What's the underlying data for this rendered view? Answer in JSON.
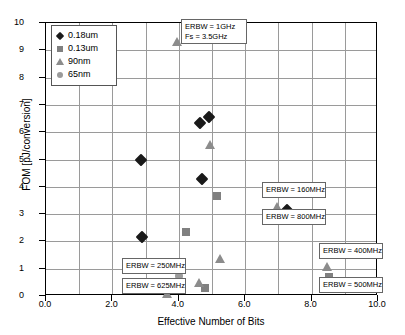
{
  "chart_data": {
    "type": "scatter",
    "title": "",
    "xlabel": "Effective Number of Bits",
    "ylabel": "FOM [pJ/conversion]",
    "xlim": [
      0.0,
      10.0
    ],
    "ylim": [
      0,
      10
    ],
    "xticks": [
      "0.0",
      "2.0",
      "4.0",
      "6.0",
      "8.0",
      "10.0"
    ],
    "xtick_values": [
      0,
      2,
      4,
      6,
      8,
      10
    ],
    "yticks": [
      "0",
      "1",
      "2",
      "3",
      "4",
      "5",
      "6",
      "7",
      "8",
      "9",
      "10"
    ],
    "ytick_values": [
      0,
      1,
      2,
      3,
      4,
      5,
      6,
      7,
      8,
      9,
      10
    ],
    "grid": "both",
    "grid_x_step": 1.0,
    "grid_y_step": 1.0,
    "legend_position": "top-left",
    "series": [
      {
        "name": "0.18um",
        "marker": "diamond",
        "color": "#1a1a1a",
        "points": [
          {
            "x": 2.85,
            "y": 5.0
          },
          {
            "x": 4.63,
            "y": 6.35
          },
          {
            "x": 4.92,
            "y": 6.57
          },
          {
            "x": 4.7,
            "y": 4.28
          },
          {
            "x": 2.88,
            "y": 2.15
          },
          {
            "x": 7.25,
            "y": 3.15
          }
        ]
      },
      {
        "name": "0.13um",
        "marker": "square",
        "color": "#808080",
        "points": [
          {
            "x": 5.15,
            "y": 3.68
          },
          {
            "x": 4.23,
            "y": 2.35
          },
          {
            "x": 4.8,
            "y": 0.28
          },
          {
            "x": 8.52,
            "y": 0.7
          }
        ]
      },
      {
        "name": "90nm",
        "marker": "triangle",
        "color": "#8c8c8c",
        "points": [
          {
            "x": 3.95,
            "y": 9.3
          },
          {
            "x": 4.95,
            "y": 5.53
          },
          {
            "x": 5.25,
            "y": 1.35
          },
          {
            "x": 6.95,
            "y": 3.28
          },
          {
            "x": 4.62,
            "y": 0.47
          },
          {
            "x": 3.63,
            "y": 0.08
          },
          {
            "x": 8.47,
            "y": 1.05
          }
        ]
      },
      {
        "name": "65nm",
        "marker": "circle",
        "color": "#9b9b9b",
        "points": [
          {
            "x": 4.0,
            "y": 0.75
          }
        ]
      }
    ],
    "annotations": [
      {
        "id": "anno-erbw-1ghz",
        "lines": [
          "ERBW = 1GHz",
          "Fs = 3.5GHz"
        ],
        "left": 181,
        "top": 19,
        "width": 66
      },
      {
        "id": "anno-erbw-160mhz",
        "lines": [
          "ERBW = 160MHz"
        ],
        "left": 262,
        "top": 182,
        "width": 64
      },
      {
        "id": "anno-erbw-800mhz",
        "lines": [
          "ERBW = 800MHz"
        ],
        "left": 262,
        "top": 209,
        "width": 64
      },
      {
        "id": "anno-erbw-250mhz",
        "lines": [
          "ERBW = 250MHz"
        ],
        "left": 122,
        "top": 258,
        "width": 64
      },
      {
        "id": "anno-erbw-625mhz",
        "lines": [
          "ERBW = 625MHz"
        ],
        "left": 122,
        "top": 278,
        "width": 64
      },
      {
        "id": "anno-erbw-400mhz",
        "lines": [
          "ERBW = 400MHz"
        ],
        "left": 319,
        "top": 243,
        "width": 64
      },
      {
        "id": "anno-erbw-500mhz",
        "lines": [
          "ERBW = 500MHz"
        ],
        "left": 319,
        "top": 277,
        "width": 64
      }
    ]
  }
}
